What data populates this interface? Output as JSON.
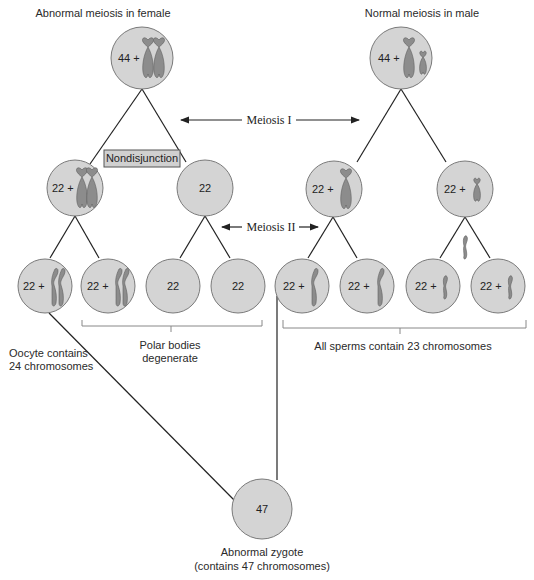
{
  "titles": {
    "female": "Abnormal meiosis in female",
    "male": "Normal meiosis in male"
  },
  "stages": {
    "meiosis1": "Meiosis I",
    "meiosis2": "Meiosis II"
  },
  "annotation": {
    "nondisjunction": "Nondisjunction"
  },
  "female": {
    "parent": "44 +",
    "secondary_left": "22 +",
    "secondary_right": "22",
    "gametes": [
      "22 +",
      "22 +",
      "22",
      "22"
    ]
  },
  "male": {
    "parent": "44 +",
    "secondary_left": "22 +",
    "secondary_right": "22 +",
    "gametes": [
      "22 +",
      "22 +",
      "22 +",
      "22 +"
    ]
  },
  "labels": {
    "oocyte_line1": "Oocyte contains",
    "oocyte_line2": "24 chromosomes",
    "polar_line1": "Polar bodies",
    "polar_line2": "degenerate",
    "sperms": "All sperms contain 23 chromosomes",
    "zygote_value": "47",
    "zygote_line1": "Abnormal zygote",
    "zygote_line2": "(contains 47 chromosomes)"
  },
  "colors": {
    "cell_fill": "#d4d4d4",
    "chromosome": "#8c8c8c",
    "line": "#222222"
  }
}
